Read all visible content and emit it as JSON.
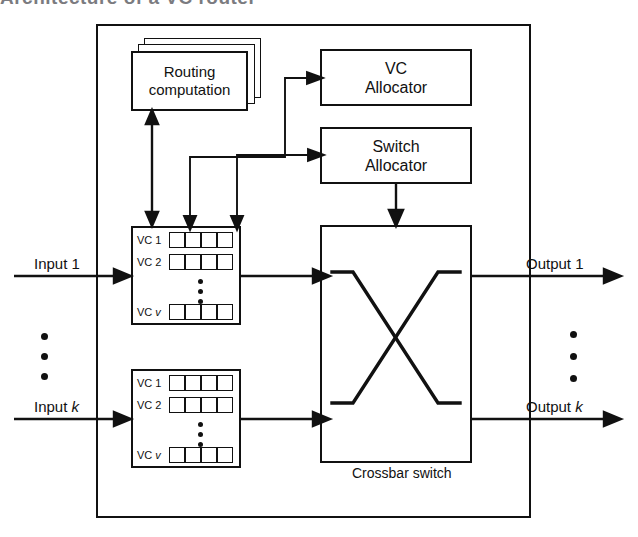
{
  "figure": {
    "title_fragment": "Architecture of a VC router",
    "outer_block_name": "virtual-channel router"
  },
  "blocks": {
    "routing": {
      "label": "Routing\ncomputation",
      "stacked": true
    },
    "vc_allocator": {
      "label": "VC\nAllocator"
    },
    "switch_allocator": {
      "label": "Switch\nAllocator"
    },
    "crossbar": {
      "caption": "Crossbar switch"
    }
  },
  "input_units": [
    {
      "port_label": "Input 1",
      "channels": [
        {
          "label": "VC 1",
          "label_prefix": "VC",
          "label_index": "1",
          "slots": 4
        },
        {
          "label": "VC 2",
          "label_prefix": "VC",
          "label_index": "2",
          "slots": 4
        },
        {
          "label": "VC v",
          "label_prefix": "VC",
          "label_index": "v",
          "slots": 4
        }
      ],
      "ellipsis": "⋮"
    },
    {
      "port_label": "Input k",
      "channels": [
        {
          "label": "VC 1",
          "label_prefix": "VC",
          "label_index": "1",
          "slots": 4
        },
        {
          "label": "VC 2",
          "label_prefix": "VC",
          "label_index": "2",
          "slots": 4
        },
        {
          "label": "VC v",
          "label_prefix": "VC",
          "label_index": "v",
          "slots": 4
        }
      ],
      "ellipsis": "⋮"
    }
  ],
  "outputs": [
    {
      "port_label": "Output 1"
    },
    {
      "port_label": "Output k"
    }
  ],
  "port_label_parts": {
    "input_1": {
      "word": "Input",
      "index": "1"
    },
    "input_k": {
      "word": "Input",
      "index": "k"
    },
    "output_1": {
      "word": "Output",
      "index": "1"
    },
    "output_k": {
      "word": "Output",
      "index": "k"
    }
  },
  "ellipsis_marks": {
    "left_inputs": "⋮",
    "right_outputs": "⋮"
  },
  "colors": {
    "stroke": "#111111",
    "background": "#ffffff",
    "title_fragment": "#7b7b80"
  }
}
